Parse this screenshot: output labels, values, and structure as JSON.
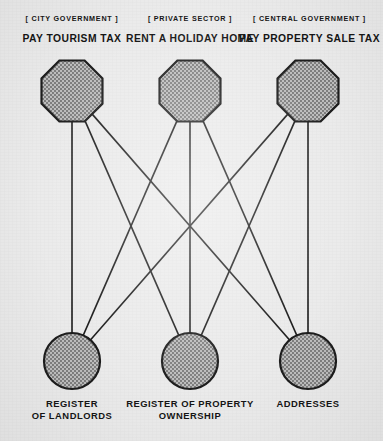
{
  "diagram": {
    "type": "bipartite-graph",
    "background_color": "#ebebeb",
    "node_fill_color": "#9a9a9a",
    "node_stroke_color": "#1a1a1a",
    "edge_color": "#1a1a1a",
    "text_color": "#121212",
    "top_nodes": [
      {
        "id": "pay-tourism-tax",
        "kicker": "[ CITY GOVERNMENT ]",
        "title": "PAY TOURISM TAX",
        "shape": "octagon",
        "cx": 72,
        "cy": 91
      },
      {
        "id": "rent-a-holiday-home",
        "kicker": "[ PRIVATE SECTOR ]",
        "title": "RENT A HOLIDAY HOME",
        "shape": "octagon",
        "cx": 190,
        "cy": 91
      },
      {
        "id": "pay-property-sale-tax",
        "kicker": "[ CENTRAL GOVERNMENT ]",
        "title": "PAY PROPERTY SALE TAX",
        "shape": "octagon",
        "cx": 308,
        "cy": 91
      }
    ],
    "bottom_nodes": [
      {
        "id": "register-of-landlords",
        "label_lines": [
          "REGISTER",
          "OF LANDLORDS"
        ],
        "shape": "circle",
        "cx": 72,
        "cy": 361
      },
      {
        "id": "register-of-property-ownership",
        "label_lines": [
          "REGISTER OF PROPERTY",
          "OWNERSHIP"
        ],
        "shape": "circle",
        "cx": 190,
        "cy": 361
      },
      {
        "id": "addresses",
        "label_lines": [
          "ADDRESSES"
        ],
        "shape": "circle",
        "cx": 308,
        "cy": 361
      }
    ],
    "edges": [
      {
        "from": "pay-tourism-tax",
        "to": "register-of-landlords"
      },
      {
        "from": "pay-tourism-tax",
        "to": "register-of-property-ownership"
      },
      {
        "from": "pay-tourism-tax",
        "to": "addresses"
      },
      {
        "from": "rent-a-holiday-home",
        "to": "register-of-landlords"
      },
      {
        "from": "rent-a-holiday-home",
        "to": "register-of-property-ownership"
      },
      {
        "from": "rent-a-holiday-home",
        "to": "addresses"
      },
      {
        "from": "pay-property-sale-tax",
        "to": "register-of-landlords"
      },
      {
        "from": "pay-property-sale-tax",
        "to": "register-of-property-ownership"
      },
      {
        "from": "pay-property-sale-tax",
        "to": "addresses"
      }
    ]
  }
}
